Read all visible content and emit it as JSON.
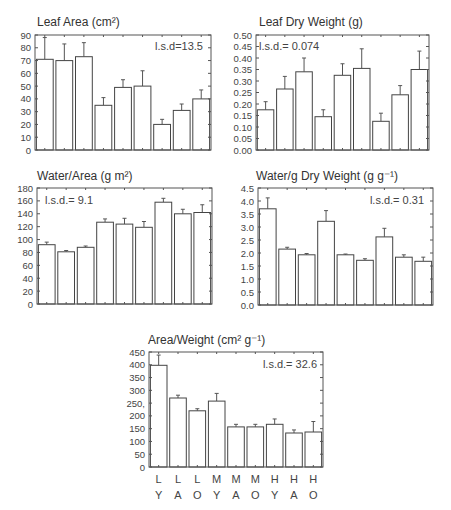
{
  "chart_data": [
    {
      "type": "bar",
      "title": "Leaf Area (cm²)",
      "annotation": "l.s.d=13.5",
      "categories": [
        "LY",
        "LA",
        "LO",
        "MY",
        "MA",
        "MO",
        "HY",
        "HA",
        "HO"
      ],
      "values": [
        71,
        70,
        73,
        35,
        49,
        50,
        20,
        31,
        40
      ],
      "error_upper": [
        88,
        83,
        84,
        41,
        55,
        62,
        24,
        36,
        47
      ],
      "ylim": [
        0,
        90
      ],
      "yticks": [
        0,
        10,
        20,
        30,
        40,
        50,
        60,
        70,
        80,
        90
      ],
      "ytick_labels": [
        "0",
        "10",
        "20",
        "30",
        "40",
        "50",
        "60",
        "70",
        "80",
        "90"
      ],
      "grid": false,
      "box": {
        "x0": 35,
        "x1": 211,
        "y0": 35,
        "y1": 150
      }
    },
    {
      "type": "bar",
      "title": "Leaf Dry Weight (g)",
      "annotation": "l.s.d.= 0.074",
      "categories": [
        "LY",
        "LA",
        "LO",
        "MY",
        "MA",
        "MO",
        "HY",
        "HA",
        "HO"
      ],
      "values": [
        0.175,
        0.265,
        0.34,
        0.145,
        0.325,
        0.355,
        0.125,
        0.24,
        0.35
      ],
      "error_upper": [
        0.21,
        0.32,
        0.4,
        0.175,
        0.375,
        0.44,
        0.16,
        0.28,
        0.43
      ],
      "ylim": [
        0,
        0.5
      ],
      "yticks": [
        0,
        0.05,
        0.1,
        0.15,
        0.2,
        0.25,
        0.3,
        0.35,
        0.4,
        0.45,
        0.5
      ],
      "ytick_labels": [
        "0.00",
        "0.05",
        "0.10",
        "0.15",
        "0.20",
        "0.25",
        "0.30",
        "0.35",
        "0.40",
        "0.45",
        "0.50"
      ],
      "grid": false,
      "box": {
        "x0": 256,
        "x1": 429,
        "y0": 35,
        "y1": 150
      }
    },
    {
      "type": "bar",
      "title": "Water/Area (g m²)",
      "annotation": "l.s.d.= 9.1",
      "categories": [
        "LY",
        "LA",
        "LO",
        "MY",
        "MA",
        "MO",
        "HY",
        "HA",
        "HO"
      ],
      "values": [
        92,
        81,
        88,
        127,
        124,
        119,
        158,
        140,
        142
      ],
      "error_upper": [
        96,
        83,
        90,
        132,
        133,
        128,
        164,
        147,
        154
      ],
      "ylim": [
        0,
        180
      ],
      "yticks": [
        0,
        20,
        40,
        60,
        80,
        100,
        120,
        140,
        160,
        180
      ],
      "ytick_labels": [
        "0",
        "20",
        "40",
        "60",
        "80",
        "100",
        "120",
        "140",
        "160",
        "180"
      ],
      "grid": false,
      "box": {
        "x0": 37,
        "x1": 212,
        "y0": 188,
        "y1": 304
      }
    },
    {
      "type": "bar",
      "title": "Water/g Dry Weight (g g⁻¹)",
      "annotation": "l.s.d.= 0.31",
      "categories": [
        "LY",
        "LA",
        "LO",
        "MY",
        "MA",
        "MO",
        "HY",
        "HA",
        "HO"
      ],
      "values": [
        3.7,
        2.15,
        1.93,
        3.22,
        1.93,
        1.72,
        2.62,
        1.84,
        1.68
      ],
      "error_upper": [
        4.12,
        2.22,
        1.98,
        3.63,
        1.96,
        1.78,
        2.95,
        1.93,
        1.84
      ],
      "ylim": [
        0,
        4.5
      ],
      "yticks": [
        0,
        0.5,
        1,
        1.5,
        2,
        2.5,
        3,
        3.5,
        4,
        4.5
      ],
      "ytick_labels": [
        "0.0",
        "0.5",
        "1.0",
        "1.5",
        "2.0",
        "2.5",
        "3.0",
        "3.5",
        "4.0",
        "4.5"
      ],
      "grid": false,
      "box": {
        "x0": 258,
        "x1": 433,
        "y0": 188,
        "y1": 305
      }
    },
    {
      "type": "bar",
      "title": "Area/Weight (cm² g⁻¹)",
      "annotation": "l.s.d.= 32.6",
      "categories": [
        "LY",
        "LA",
        "LO",
        "MY",
        "MA",
        "MO",
        "HY",
        "HA",
        "HO"
      ],
      "values": [
        398,
        270,
        220,
        258,
        157,
        157,
        167,
        133,
        137
      ],
      "error_upper": [
        438,
        281,
        228,
        288,
        167,
        167,
        188,
        145,
        178
      ],
      "ylim": [
        0,
        450
      ],
      "yticks": [
        0,
        50,
        100,
        150,
        200,
        250,
        300,
        350,
        400,
        450
      ],
      "ytick_labels": [
        "0",
        "50",
        "100",
        "150",
        "200",
        "250,",
        "300",
        "350",
        "400",
        "450"
      ],
      "grid": false,
      "box": {
        "x0": 149,
        "x1": 323,
        "y0": 352,
        "y1": 467
      },
      "xlabels_row1": [
        "L",
        "L",
        "L",
        "M",
        "M",
        "M",
        "H",
        "H",
        "H"
      ],
      "xlabels_row2": [
        "Y",
        "A",
        "O",
        "Y",
        "A",
        "O",
        "Y",
        "A",
        "O"
      ]
    }
  ]
}
